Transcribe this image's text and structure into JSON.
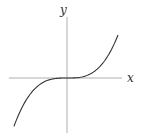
{
  "chart_data": {
    "type": "line",
    "title": "",
    "xlabel": "x",
    "ylabel": "y",
    "function": "y = x^3",
    "grid": false,
    "legend": null,
    "ticks": false,
    "xlim": [
      -1.15,
      1.1
    ],
    "ylim": [
      -1.3,
      1.25
    ],
    "series": [
      {
        "name": "y = x^3",
        "x": [
          -1.05,
          -0.9,
          -0.75,
          -0.6,
          -0.45,
          -0.3,
          -0.15,
          0,
          0.15,
          0.3,
          0.45,
          0.6,
          0.75,
          0.9,
          1.0
        ],
        "y": [
          -1.158,
          -0.729,
          -0.422,
          -0.216,
          -0.091,
          -0.027,
          -0.003,
          0,
          0.003,
          0.027,
          0.091,
          0.216,
          0.422,
          0.729,
          1.0
        ]
      }
    ]
  },
  "labels": {
    "x_axis": "x",
    "y_axis": "y"
  },
  "style": {
    "axis_color": "#9a9a9a",
    "curve_color": "#333333"
  }
}
